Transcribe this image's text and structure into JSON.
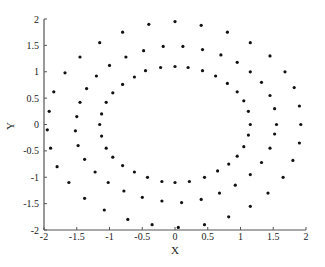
{
  "chart_data": {
    "type": "scatter",
    "title": "",
    "xlabel": "X",
    "ylabel": "Y",
    "xlim": [
      -2,
      2
    ],
    "ylim": [
      -2,
      2
    ],
    "grid": false,
    "legend": null,
    "x_ticks": [
      "-2",
      "-1.5",
      "-1",
      "-0.5",
      "0",
      "0.5",
      "1",
      "1.5",
      "2"
    ],
    "y_ticks": [
      "-2",
      "-1.5",
      "-1",
      "-0.5",
      "0",
      "0.5",
      "1",
      "1.5",
      "2"
    ],
    "marker_color": "#111111",
    "series": [
      {
        "name": "inner ring",
        "approx_radius": 1.1,
        "points": [
          [
            1.15,
            0.0
          ],
          [
            1.12,
            0.25
          ],
          [
            1.05,
            0.45
          ],
          [
            0.95,
            0.62
          ],
          [
            0.8,
            0.78
          ],
          [
            0.62,
            0.92
          ],
          [
            0.42,
            1.02
          ],
          [
            0.2,
            1.08
          ],
          [
            0.0,
            1.1
          ],
          [
            -0.22,
            1.08
          ],
          [
            -0.45,
            1.02
          ],
          [
            -0.62,
            0.9
          ],
          [
            -0.8,
            0.76
          ],
          [
            -0.95,
            0.6
          ],
          [
            -1.05,
            0.42
          ],
          [
            -1.12,
            0.2
          ],
          [
            -1.15,
            0.0
          ],
          [
            -1.12,
            -0.22
          ],
          [
            -1.05,
            -0.45
          ],
          [
            -0.95,
            -0.62
          ],
          [
            -0.8,
            -0.78
          ],
          [
            -0.62,
            -0.9
          ],
          [
            -0.42,
            -1.0
          ],
          [
            -0.2,
            -1.08
          ],
          [
            0.0,
            -1.1
          ],
          [
            0.22,
            -1.08
          ],
          [
            0.45,
            -1.0
          ],
          [
            0.65,
            -0.88
          ],
          [
            0.82,
            -0.75
          ],
          [
            0.95,
            -0.6
          ],
          [
            1.05,
            -0.42
          ],
          [
            1.12,
            -0.2
          ]
        ]
      },
      {
        "name": "middle ring",
        "approx_radius": 1.5,
        "points": [
          [
            1.55,
            0.0
          ],
          [
            1.52,
            0.3
          ],
          [
            1.45,
            0.55
          ],
          [
            1.32,
            0.8
          ],
          [
            1.15,
            1.0
          ],
          [
            0.95,
            1.18
          ],
          [
            0.7,
            1.32
          ],
          [
            0.42,
            1.42
          ],
          [
            0.12,
            1.48
          ],
          [
            -0.18,
            1.48
          ],
          [
            -0.48,
            1.4
          ],
          [
            -0.75,
            1.28
          ],
          [
            -1.0,
            1.12
          ],
          [
            -1.2,
            0.92
          ],
          [
            -1.35,
            0.68
          ],
          [
            -1.45,
            0.42
          ],
          [
            -1.5,
            0.15
          ],
          [
            -1.52,
            -0.12
          ],
          [
            -1.48,
            -0.4
          ],
          [
            -1.38,
            -0.66
          ],
          [
            -1.22,
            -0.9
          ],
          [
            -1.02,
            -1.1
          ],
          [
            -0.78,
            -1.26
          ],
          [
            -0.5,
            -1.38
          ],
          [
            -0.2,
            -1.45
          ],
          [
            0.1,
            -1.48
          ],
          [
            0.4,
            -1.42
          ],
          [
            0.68,
            -1.3
          ],
          [
            0.92,
            -1.15
          ],
          [
            1.15,
            -0.95
          ],
          [
            1.32,
            -0.72
          ],
          [
            1.45,
            -0.45
          ],
          [
            1.52,
            -0.18
          ]
        ]
      },
      {
        "name": "outer ring",
        "approx_radius": 1.9,
        "points": [
          [
            1.92,
            0.0
          ],
          [
            1.9,
            0.35
          ],
          [
            1.82,
            0.7
          ],
          [
            1.68,
            1.0
          ],
          [
            1.45,
            1.3
          ],
          [
            1.15,
            1.55
          ],
          [
            0.8,
            1.75
          ],
          [
            0.4,
            1.88
          ],
          [
            0.0,
            1.95
          ],
          [
            -0.4,
            1.9
          ],
          [
            -0.8,
            1.75
          ],
          [
            -1.15,
            1.55
          ],
          [
            -1.45,
            1.28
          ],
          [
            -1.68,
            0.98
          ],
          [
            -1.85,
            0.62
          ],
          [
            -1.92,
            0.25
          ],
          [
            -1.95,
            -0.1
          ],
          [
            -1.9,
            -0.45
          ],
          [
            -1.8,
            -0.8
          ],
          [
            -1.62,
            -1.1
          ],
          [
            -1.38,
            -1.4
          ],
          [
            -1.08,
            -1.62
          ],
          [
            -0.72,
            -1.8
          ],
          [
            -0.35,
            -1.9
          ],
          [
            0.05,
            -1.95
          ],
          [
            0.45,
            -1.9
          ],
          [
            0.82,
            -1.75
          ],
          [
            1.15,
            -1.55
          ],
          [
            1.42,
            -1.3
          ],
          [
            1.65,
            -1.0
          ],
          [
            1.8,
            -0.68
          ],
          [
            1.9,
            -0.35
          ]
        ]
      }
    ]
  }
}
